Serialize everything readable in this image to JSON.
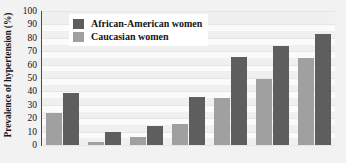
{
  "chart_data": {
    "type": "bar",
    "title": "",
    "xlabel": "",
    "ylabel": "Prevalence of hypertension (%)",
    "ylim": [
      0,
      100
    ],
    "ytick_step": 10,
    "yticks": [
      100,
      90,
      80,
      70,
      60,
      50,
      40,
      30,
      20,
      10,
      0
    ],
    "grid": "horizontal",
    "legend_position": "top-center",
    "categories": [
      "1",
      "2",
      "3",
      "4",
      "5",
      "6",
      "7"
    ],
    "xtick_labels": [
      "",
      "",
      "",
      "",
      "",
      "",
      ""
    ],
    "series": [
      {
        "name": "Caucasian women",
        "color": "#a0a0a0",
        "values": [
          24,
          2,
          6,
          16,
          35,
          49,
          65
        ]
      },
      {
        "name": "African-American women",
        "color": "#5e5e5e",
        "values": [
          39,
          10,
          14,
          36,
          66,
          74,
          83
        ]
      }
    ]
  },
  "legend": {
    "entries": [
      {
        "label": "African-American women",
        "color": "#5e5e5e"
      },
      {
        "label": "Caucasian women",
        "color": "#a0a0a0"
      }
    ]
  },
  "axis": {
    "y_title": "Prevalence of hypertension (%)",
    "y_tick_labels": [
      "100",
      "90",
      "80",
      "70",
      "60",
      "50",
      "40",
      "30",
      "20",
      "10",
      "0"
    ]
  },
  "colors": {
    "african_american": "#5e5e5e",
    "caucasian": "#a0a0a0",
    "plot_background": "#fbfbfb",
    "figure_background": "#f2f2f2",
    "gridline": "#e6e6e6",
    "axis_line": "#4a4a4a"
  }
}
